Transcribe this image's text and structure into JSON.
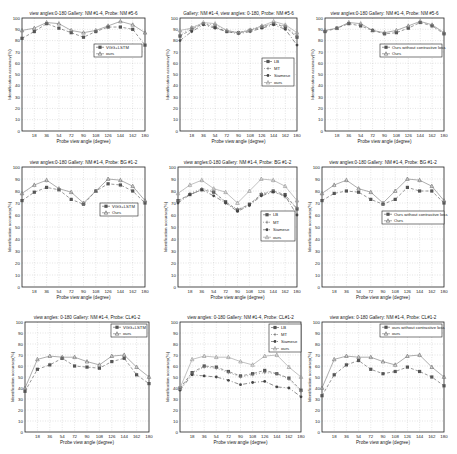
{
  "figure": {
    "x_ticks": [
      18,
      36,
      54,
      72,
      90,
      108,
      126,
      144,
      162,
      180
    ],
    "x_categories": [
      0,
      18,
      36,
      54,
      72,
      90,
      108,
      126,
      144,
      162,
      180
    ],
    "y_ticks": [
      0,
      10,
      20,
      30,
      40,
      50,
      60,
      70,
      80,
      90,
      100
    ],
    "xlabel": "Probe view angle (degree)",
    "ylabel": "Identification accuracy(%)"
  },
  "chart_data": [
    {
      "type": "line",
      "title": "view angles:0-180 Gallery: NM #1-4,  Probe: NM #5-6",
      "xlabel": "Probe view angle (degree)",
      "ylabel": "Identification accuracy(%)",
      "ylim": [
        0,
        100
      ],
      "xlim": [
        0,
        180
      ],
      "grid": true,
      "legend_position": "mid-right",
      "box": {
        "x": 22,
        "y": 18,
        "w": 123,
        "h": 113
      },
      "legend_box": {
        "x": 94,
        "y": 44,
        "w": 48,
        "h": 13
      },
      "categories": [
        0,
        18,
        36,
        54,
        72,
        90,
        108,
        126,
        144,
        162,
        180
      ],
      "series": [
        {
          "name": "VGG+LSTM",
          "marker": "square",
          "dash": "3,2",
          "values": [
            82,
            88,
            95,
            91,
            87,
            83,
            88,
            92,
            92,
            90,
            76
          ]
        },
        {
          "name": "ours",
          "marker": "triangle",
          "dash": "",
          "values": [
            89,
            91,
            96,
            95,
            89,
            87,
            89,
            93,
            97,
            94,
            87
          ]
        }
      ]
    },
    {
      "type": "line",
      "title": "Gallery: NM #1-4,  view angles: 0-180,  Probe: NM #5-6",
      "xlabel": "Probe view angle (degree)",
      "ylabel": "Identification accuracy(%)",
      "ylim": [
        0,
        100
      ],
      "xlim": [
        0,
        180
      ],
      "grid": true,
      "legend_position": "mid-right",
      "box": {
        "x": 180,
        "y": 18,
        "w": 117,
        "h": 113
      },
      "legend_box": {
        "x": 262,
        "y": 58,
        "w": 32,
        "h": 28
      },
      "categories": [
        0,
        18,
        36,
        54,
        72,
        90,
        108,
        126,
        144,
        162,
        180
      ],
      "series": [
        {
          "name": "LB",
          "marker": "square",
          "dash": "3,2",
          "values": [
            84,
            90,
            95,
            92,
            88,
            87,
            89,
            92,
            95,
            92,
            83
          ]
        },
        {
          "name": "MT",
          "marker": "plus",
          "dash": "1,2",
          "values": [
            85,
            92,
            95,
            94,
            89,
            87,
            90,
            93,
            95,
            93,
            84
          ]
        },
        {
          "name": "Siamese",
          "marker": "circle",
          "dash": "4,2,1,2",
          "values": [
            80,
            88,
            94,
            91,
            88,
            86,
            88,
            91,
            94,
            90,
            76
          ]
        },
        {
          "name": "ours",
          "marker": "triangle",
          "dash": "",
          "values": [
            89,
            91,
            96,
            95,
            89,
            87,
            89,
            93,
            97,
            94,
            87
          ]
        }
      ]
    },
    {
      "type": "line",
      "title": "view angles:0-180 Gallery: NM #1-4,  Probe: NM #5-6",
      "xlabel": "Probe view angle (degree)",
      "ylabel": "Identification accuracy(%)",
      "ylim": [
        0,
        100
      ],
      "xlim": [
        0,
        180
      ],
      "grid": true,
      "legend_position": "mid-right",
      "box": {
        "x": 325,
        "y": 18,
        "w": 119,
        "h": 113
      },
      "legend_box": {
        "x": 380,
        "y": 44,
        "w": 62,
        "h": 13
      },
      "categories": [
        0,
        18,
        36,
        54,
        72,
        90,
        108,
        126,
        144,
        162,
        180
      ],
      "series": [
        {
          "name": "Ours without contrastive loss",
          "marker": "square",
          "dash": "3,2",
          "values": [
            88,
            91,
            95,
            93,
            89,
            86,
            87,
            91,
            96,
            93,
            86
          ]
        },
        {
          "name": "Ours",
          "marker": "triangle",
          "dash": "",
          "values": [
            89,
            91,
            96,
            95,
            89,
            87,
            89,
            93,
            97,
            94,
            87
          ]
        }
      ]
    },
    {
      "type": "line",
      "title": "view angles:0-180 Gallery: NM #1-4,  Probe: BG #1-2",
      "xlabel": "Probe view angle (degree)",
      "ylabel": "Identification accuracy(%)",
      "ylim": [
        0,
        100
      ],
      "xlim": [
        0,
        180
      ],
      "grid": true,
      "legend_position": "mid-right",
      "box": {
        "x": 22,
        "y": 167,
        "w": 123,
        "h": 120
      },
      "legend_box": {
        "x": 100,
        "y": 203,
        "w": 38,
        "h": 13
      },
      "categories": [
        0,
        18,
        36,
        54,
        72,
        90,
        108,
        126,
        144,
        162,
        180
      ],
      "series": [
        {
          "name": "VGG+LSTM",
          "marker": "square",
          "dash": "3,2",
          "values": [
            72,
            79,
            83,
            81,
            73,
            69,
            80,
            86,
            85,
            80,
            70
          ]
        },
        {
          "name": "Ours",
          "marker": "triangle",
          "dash": "",
          "values": [
            78,
            85,
            89,
            82,
            79,
            70,
            80,
            90,
            89,
            84,
            72
          ]
        }
      ]
    },
    {
      "type": "line",
      "title": "view angles:0-180 Gallery: NM #1-4,  Probe: BG #1-2",
      "xlabel": "Probe view angle (degree)",
      "ylabel": "Identification accuracy(%)",
      "ylim": [
        0,
        100
      ],
      "xlim": [
        0,
        180
      ],
      "grid": true,
      "legend_position": "mid-right",
      "box": {
        "x": 178,
        "y": 167,
        "w": 119,
        "h": 120
      },
      "legend_box": {
        "x": 261,
        "y": 211,
        "w": 34,
        "h": 30
      },
      "categories": [
        0,
        18,
        36,
        54,
        72,
        90,
        108,
        126,
        144,
        162,
        180
      ],
      "series": [
        {
          "name": "LB",
          "marker": "square",
          "dash": "3,2",
          "values": [
            72,
            77,
            81,
            79,
            71,
            64,
            69,
            77,
            80,
            77,
            65
          ]
        },
        {
          "name": "MT",
          "marker": "plus",
          "dash": "1,2",
          "values": [
            71,
            78,
            82,
            80,
            70,
            65,
            68,
            78,
            80,
            75,
            66
          ]
        },
        {
          "name": "Siamese",
          "marker": "circle",
          "dash": "4,2,1,2",
          "values": [
            70,
            77,
            81,
            76,
            70,
            63,
            68,
            76,
            79,
            76,
            60
          ]
        },
        {
          "name": "ours",
          "marker": "triangle",
          "dash": "",
          "values": [
            78,
            85,
            89,
            82,
            79,
            70,
            80,
            90,
            89,
            84,
            72
          ]
        }
      ]
    },
    {
      "type": "line",
      "title": "view angles:0-180 Gallery: NM #1-4,  Probe: BG #1-2",
      "xlabel": "Probe view angle (degree)",
      "ylabel": "Identification accuracy(%)",
      "ylim": [
        0,
        100
      ],
      "xlim": [
        0,
        180
      ],
      "grid": true,
      "legend_position": "mid-right",
      "box": {
        "x": 322,
        "y": 167,
        "w": 122,
        "h": 120
      },
      "legend_box": {
        "x": 382,
        "y": 211,
        "w": 62,
        "h": 13
      },
      "categories": [
        0,
        18,
        36,
        54,
        72,
        90,
        108,
        126,
        144,
        162,
        180
      ],
      "series": [
        {
          "name": "Ours without contrastive loss",
          "marker": "square",
          "dash": "3,2",
          "values": [
            72,
            78,
            80,
            79,
            73,
            69,
            73,
            83,
            80,
            80,
            70
          ]
        },
        {
          "name": "Ours",
          "marker": "triangle",
          "dash": "",
          "values": [
            78,
            85,
            89,
            82,
            79,
            70,
            80,
            90,
            89,
            84,
            72
          ]
        }
      ]
    },
    {
      "type": "line",
      "title": "view angles: 0-180  Gallery: NM #1-4,  Probe: CL#1-2",
      "xlabel": "Probe view angle (degree)",
      "ylabel": "Identification accuracy(%)",
      "ylim": [
        0,
        100
      ],
      "xlim": [
        0,
        180
      ],
      "grid": true,
      "legend_position": "upper-right",
      "box": {
        "x": 25,
        "y": 322,
        "w": 124,
        "h": 110
      },
      "legend_box": {
        "x": 111,
        "y": 324,
        "w": 36,
        "h": 13
      },
      "categories": [
        0,
        18,
        36,
        54,
        72,
        90,
        108,
        126,
        144,
        162,
        180
      ],
      "series": [
        {
          "name": "VGG+LSTM",
          "marker": "square",
          "dash": "3,2",
          "values": [
            37,
            57,
            61,
            67,
            60,
            59,
            58,
            64,
            67,
            52,
            44
          ]
        },
        {
          "name": "ours",
          "marker": "triangle",
          "dash": "",
          "values": [
            40,
            66,
            69,
            68,
            68,
            64,
            61,
            69,
            70,
            59,
            50
          ]
        }
      ]
    },
    {
      "type": "line",
      "title": "view angles: 0-180  Gallery: NM #1-4,  Probe: CL#1-2",
      "xlabel": "Probe view angle (degree)",
      "ylabel": "Identification accuracy(%)",
      "ylim": [
        0,
        100
      ],
      "xlim": [
        0,
        180
      ],
      "grid": true,
      "legend_position": "upper-right",
      "box": {
        "x": 180,
        "y": 322,
        "w": 121,
        "h": 110
      },
      "legend_box": {
        "x": 269,
        "y": 324,
        "w": 32,
        "h": 28
      },
      "categories": [
        0,
        18,
        36,
        54,
        72,
        90,
        108,
        126,
        144,
        162,
        180
      ],
      "series": [
        {
          "name": "LB",
          "marker": "square",
          "dash": "3,2",
          "values": [
            40,
            54,
            60,
            59,
            55,
            51,
            53,
            56,
            53,
            49,
            38
          ]
        },
        {
          "name": "MT",
          "marker": "plus",
          "dash": "1,2",
          "values": [
            39,
            53,
            59,
            58,
            54,
            50,
            52,
            54,
            53,
            48,
            37
          ]
        },
        {
          "name": "Siamese",
          "marker": "circle",
          "dash": "4,2,1,2",
          "values": [
            38,
            52,
            51,
            50,
            47,
            43,
            45,
            46,
            41,
            40,
            32
          ]
        },
        {
          "name": "ours",
          "marker": "triangle",
          "dash": "",
          "values": [
            40,
            66,
            69,
            68,
            68,
            64,
            61,
            69,
            70,
            59,
            50
          ]
        }
      ]
    },
    {
      "type": "line",
      "title": "view angles: 0-180  Gallery: NM #1-4,  Probe: CL#1-2",
      "xlabel": "Probe view angle (degree)",
      "ylabel": "Identification accuracy(%)",
      "ylim": [
        0,
        100
      ],
      "xlim": [
        0,
        180
      ],
      "grid": true,
      "legend_position": "upper-right",
      "box": {
        "x": 322,
        "y": 322,
        "w": 122,
        "h": 110
      },
      "legend_box": {
        "x": 380,
        "y": 324,
        "w": 62,
        "h": 13
      },
      "categories": [
        0,
        18,
        36,
        54,
        72,
        90,
        108,
        126,
        144,
        162,
        180
      ],
      "series": [
        {
          "name": "ours without contrastive loss",
          "marker": "square",
          "dash": "3,2",
          "values": [
            33,
            52,
            61,
            65,
            57,
            53,
            55,
            59,
            55,
            50,
            42
          ]
        },
        {
          "name": "ours",
          "marker": "triangle",
          "dash": "",
          "values": [
            40,
            66,
            69,
            68,
            68,
            64,
            61,
            69,
            70,
            59,
            50
          ]
        }
      ]
    }
  ]
}
